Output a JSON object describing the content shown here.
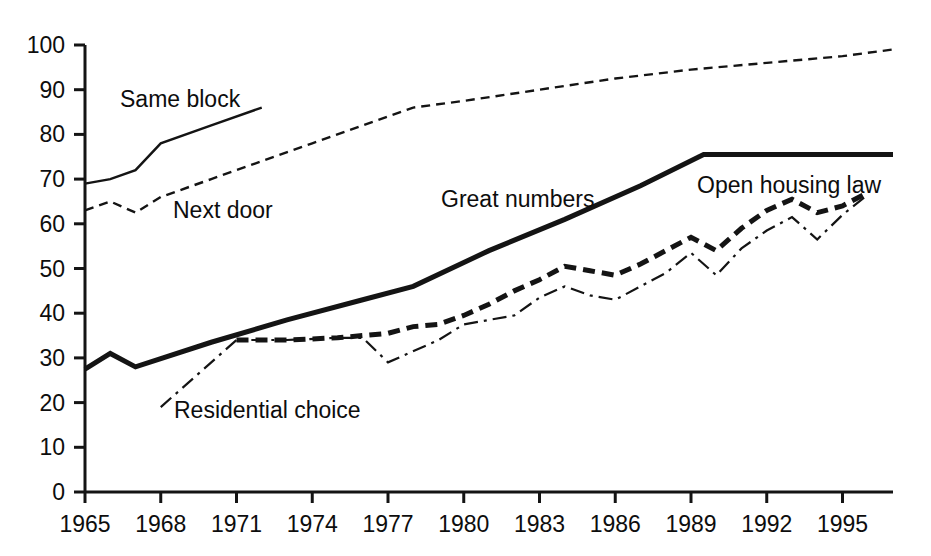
{
  "chart_data": {
    "type": "line",
    "title": "",
    "subtitle": "",
    "xlabel": "",
    "ylabel": "",
    "xlim": [
      1965,
      1997
    ],
    "ylim": [
      0,
      100
    ],
    "grid": false,
    "legend_position": "inline-labels",
    "x_ticks": [
      "1965",
      "1968",
      "1971",
      "1974",
      "1977",
      "1980",
      "1983",
      "1986",
      "1989",
      "1992",
      "1995"
    ],
    "x_tick_values": [
      1965,
      1968,
      1971,
      1974,
      1977,
      1980,
      1983,
      1986,
      1989,
      1992,
      1995
    ],
    "y_ticks": [
      "0",
      "10",
      "20",
      "30",
      "40",
      "50",
      "60",
      "70",
      "80",
      "90",
      "100"
    ],
    "y_tick_values": [
      0,
      10,
      20,
      30,
      40,
      50,
      60,
      70,
      80,
      90,
      100
    ],
    "series": [
      {
        "name": "Same block",
        "label": "Same block",
        "style": "solid-thin",
        "color": "#141414",
        "x": [
          1965,
          1966,
          1967,
          1968,
          1970,
          1972
        ],
        "values": [
          69,
          70,
          72,
          78,
          82,
          86
        ]
      },
      {
        "name": "Next door",
        "label": "Next door",
        "style": "dashed-thin",
        "color": "#141414",
        "x": [
          1965,
          1966,
          1967,
          1968,
          1970,
          1972,
          1974,
          1976,
          1978,
          1980,
          1983,
          1986,
          1989,
          1992,
          1995,
          1997
        ],
        "values": [
          63,
          65,
          62.5,
          66,
          70,
          74,
          78,
          82,
          86,
          87.5,
          90,
          92.5,
          94.5,
          96,
          97.5,
          99
        ]
      },
      {
        "name": "Great numbers",
        "label": "Great numbers",
        "style": "solid-thick",
        "color": "#141414",
        "x": [
          1965,
          1966,
          1967,
          1970,
          1973,
          1976,
          1978,
          1981,
          1984,
          1987,
          1989.5,
          1997
        ],
        "values": [
          27.5,
          31,
          28,
          33.5,
          38.5,
          43,
          46,
          54,
          61,
          68.5,
          75.5,
          75.5
        ]
      },
      {
        "name": "Residential choice (open housing law)",
        "label": "Open housing law",
        "style": "dashed-thick",
        "color": "#141414",
        "x": [
          1971,
          1973,
          1975,
          1976,
          1977,
          1978,
          1979,
          1980,
          1981,
          1982,
          1983,
          1984,
          1985,
          1986,
          1987,
          1988,
          1989,
          1990,
          1991,
          1992,
          1993,
          1994,
          1995,
          1996
        ],
        "values": [
          34,
          34,
          34.5,
          35,
          35.5,
          37,
          37.5,
          39.5,
          42,
          45,
          47.5,
          50.5,
          49.5,
          48.5,
          51,
          54,
          57,
          54,
          59,
          63,
          65.5,
          62.5,
          64,
          67
        ]
      },
      {
        "name": "Residential choice",
        "label": "Residential choice",
        "style": "dashdot-thin",
        "color": "#141414",
        "x": [
          1968,
          1971,
          1973,
          1975,
          1976,
          1977,
          1979,
          1980,
          1981,
          1982,
          1983,
          1984,
          1985,
          1986,
          1987,
          1988,
          1989,
          1990,
          1991,
          1992,
          1993,
          1994,
          1995,
          1996
        ],
        "values": [
          19,
          34,
          34,
          34.5,
          34.5,
          29,
          34,
          37.5,
          38.5,
          39.5,
          43.5,
          46,
          44,
          43,
          46,
          49,
          53.5,
          48.5,
          54.5,
          58.5,
          61.5,
          56.5,
          62,
          66.5
        ]
      }
    ],
    "annotations": [
      {
        "text": "Same block",
        "x_px": 120,
        "y_px": 107
      },
      {
        "text": "Next door",
        "x_px": 173,
        "y_px": 218
      },
      {
        "text": "Great numbers",
        "x_px": 441,
        "y_px": 207
      },
      {
        "text": "Open housing law",
        "x_px": 697,
        "y_px": 193
      },
      {
        "text": "Residential choice",
        "x_px": 174,
        "y_px": 418
      }
    ]
  }
}
